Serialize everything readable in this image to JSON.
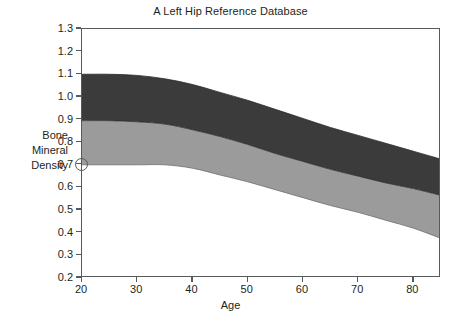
{
  "chart_data": {
    "type": "area",
    "title": "A Left Hip Reference Database",
    "xlabel": "Age",
    "ylabel": "Bone Mineral Density",
    "ylabel_lines": [
      "Bone",
      "Mineral",
      "Density"
    ],
    "xlim": [
      20,
      85
    ],
    "ylim": [
      0.2,
      1.3
    ],
    "grid": false,
    "legend": null,
    "xticks": [
      20,
      30,
      40,
      50,
      60,
      70,
      80
    ],
    "xtick_labels": [
      "20",
      "30",
      "40",
      "50",
      "60",
      "70",
      "80"
    ],
    "yticks": [
      0.2,
      0.3,
      0.4,
      0.5,
      0.6,
      0.7,
      0.8,
      0.9,
      1.0,
      1.1,
      1.2,
      1.3
    ],
    "ytick_labels": [
      "0.2",
      "0.3",
      "0.4",
      "0.5",
      "0.6",
      "0.7",
      "0.8",
      "0.9",
      "1.0",
      "1.1",
      "1.2",
      "1.3"
    ],
    "x": [
      20,
      25,
      30,
      35,
      40,
      45,
      50,
      55,
      60,
      65,
      70,
      75,
      80,
      85
    ],
    "series": [
      {
        "name": "upper-boundary",
        "role": "top of dark band",
        "values": [
          1.1,
          1.1,
          1.095,
          1.08,
          1.055,
          1.02,
          0.985,
          0.945,
          0.905,
          0.865,
          0.83,
          0.795,
          0.76,
          0.725
        ]
      },
      {
        "name": "middle-boundary",
        "role": "dark/light band divide",
        "values": [
          0.895,
          0.895,
          0.89,
          0.88,
          0.855,
          0.825,
          0.79,
          0.75,
          0.715,
          0.68,
          0.65,
          0.62,
          0.595,
          0.565
        ]
      },
      {
        "name": "lower-boundary",
        "role": "bottom of light band",
        "values": [
          0.7,
          0.7,
          0.7,
          0.7,
          0.685,
          0.655,
          0.625,
          0.59,
          0.555,
          0.52,
          0.49,
          0.455,
          0.42,
          0.375
        ]
      }
    ],
    "bands": [
      {
        "name": "dark-band",
        "color": "#3b3b3b",
        "between": [
          "upper-boundary",
          "middle-boundary"
        ]
      },
      {
        "name": "light-band",
        "color": "#9b9b9b",
        "between": [
          "middle-boundary",
          "lower-boundary"
        ]
      }
    ],
    "annotations": [
      {
        "name": "patient-marker",
        "shape": "open-circle",
        "x": 20,
        "y": 0.7
      }
    ],
    "colors": {
      "axis": "#58595b",
      "text": "#231f20",
      "dark_band": "#3b3b3b",
      "light_band": "#9b9b9b",
      "background": "#ffffff"
    }
  }
}
